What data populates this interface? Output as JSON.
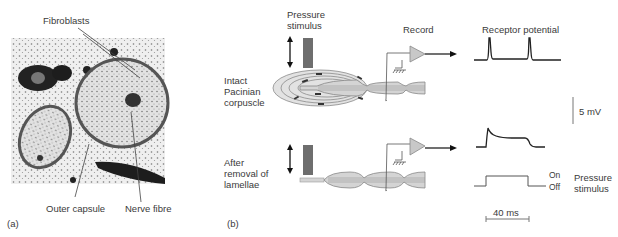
{
  "panel_a": {
    "label": "(a)",
    "annotations": {
      "fibroblasts": "Fibroblasts",
      "outer_capsule": "Outer capsule",
      "nerve_fibre": "Nerve fibre"
    }
  },
  "panel_b": {
    "label": "(b)",
    "headers": {
      "pressure_stimulus": "Pressure\nstimulus",
      "record": "Record",
      "receptor_potential": "Receptor potential"
    },
    "conditions": [
      {
        "label": "Intact\nPacinian\ncorpuscle",
        "response": "rapidly adapting: brief spikes at stimulus on and off"
      },
      {
        "label": "After\nremoval of\nlamellae",
        "response": "slowly adapting: sustained depolarization during stimulus"
      }
    ],
    "scale_bar_voltage": "5 mV",
    "scale_bar_time": "40 ms",
    "stimulus_trace": {
      "on_label": "On",
      "off_label": "Off",
      "title": "Pressure\nstimulus"
    }
  },
  "colors": {
    "stimulus_block": "#6e6e6e",
    "amplifier": "#c8c8c8",
    "corpuscle_fill": "#dcdcdc",
    "lamella_stroke": "#8a8a8a",
    "trace": "#222222"
  }
}
